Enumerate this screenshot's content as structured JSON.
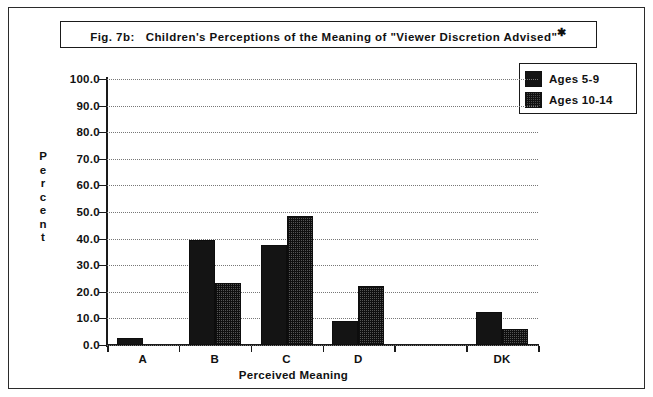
{
  "figure": {
    "title_prefix": "Fig. 7b:",
    "title_main": "Children's Perceptions of the Meaning of \"Viewer Discretion Advised\"",
    "title_footnote_marker": "*"
  },
  "legend": {
    "position": "top-right",
    "entries": [
      {
        "label": "Ages  5-9",
        "pattern": "solid-black",
        "color": "#141414"
      },
      {
        "label": "Ages  10-14",
        "pattern": "dotted-gray",
        "color": "#555555"
      }
    ]
  },
  "axes": {
    "y_title_letters": [
      "P",
      "e",
      "r",
      "c",
      "e",
      "n",
      "t"
    ],
    "y_title": "Percent",
    "y_ticks": [
      "100.0",
      "90.0",
      "80.0",
      "70.0",
      "60.0",
      "50.0",
      "40.0",
      "30.0",
      "20.0",
      "10.0",
      "0.0"
    ],
    "x_title": "Perceived Meaning",
    "x_tick_labels": [
      "A",
      "B",
      "C",
      "D",
      "",
      "DK"
    ]
  },
  "chart_data": {
    "type": "bar",
    "xlabel": "Perceived Meaning",
    "ylabel": "Percent",
    "ylim": [
      0,
      100
    ],
    "ytick_step": 10,
    "grid": true,
    "legend_position": "top-right",
    "categories": [
      "A",
      "B",
      "C",
      "D",
      "",
      "DK"
    ],
    "series": [
      {
        "name": "Ages  5-9",
        "values": [
          2.5,
          39.5,
          37.5,
          9.0,
          0,
          12.5
        ]
      },
      {
        "name": "Ages  10-14",
        "values": [
          0,
          23.5,
          48.5,
          22.0,
          0,
          6.0
        ]
      }
    ]
  }
}
